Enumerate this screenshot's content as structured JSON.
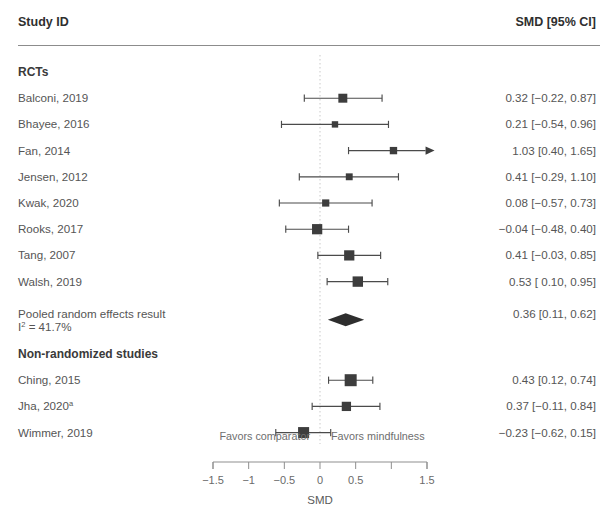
{
  "header": {
    "study_col_label": "Study ID",
    "estimate_col_label": "SMD [95% CI]"
  },
  "sections": [
    {
      "label": "RCTs"
    },
    {
      "label": "Non-randomized studies"
    }
  ],
  "pooled": {
    "label": "Pooled random effects result",
    "heterogeneity_prefix": "I",
    "heterogeneity_sup": "2",
    "heterogeneity_value": " = 41.7%",
    "estimate_text": "0.36 [0.11, 0.62]"
  },
  "axis": {
    "title": "SMD",
    "favors_left": "Favors comparator",
    "favors_right": "Favors mindfulness",
    "tick_values": [
      -1.5,
      -1,
      -0.5,
      0,
      0.5,
      1,
      1.5
    ],
    "tick_labels": [
      "−1.5",
      "−1",
      "−0.5",
      "0",
      "0.5",
      "",
      "1.5"
    ],
    "zero_reference": 0
  },
  "colors": {
    "marker": "#3d3d3d",
    "line": "#4b4b4b",
    "zero_line": "#c9c9c9",
    "rule": "#8c8c8c",
    "text": "#555555"
  },
  "chart_data": {
    "type": "forest",
    "title": "",
    "xlabel": "SMD",
    "ylabel": "",
    "xlim": [
      -1.75,
      1.75
    ],
    "effect_measure": "SMD",
    "ci_level": 95,
    "grid": false,
    "legend": "none",
    "groups": [
      {
        "name": "RCTs",
        "rows": [
          {
            "study": "Balconi, 2019",
            "estimate": 0.32,
            "ci_low": -0.22,
            "ci_high": 0.87,
            "weight": 0.62,
            "text": "0.32 [−0.22, 0.87]",
            "truncated_right": false
          },
          {
            "study": "Bhayee, 2016",
            "estimate": 0.21,
            "ci_low": -0.54,
            "ci_high": 0.96,
            "weight": 0.3,
            "text": "0.21 [−0.54, 0.96]",
            "truncated_right": false
          },
          {
            "study": "Fan, 2014",
            "estimate": 1.03,
            "ci_low": 0.4,
            "ci_high": 1.65,
            "weight": 0.42,
            "text": "1.03 [0.40, 1.65]",
            "truncated_right": true
          },
          {
            "study": "Jensen, 2012",
            "estimate": 0.41,
            "ci_low": -0.29,
            "ci_high": 1.1,
            "weight": 0.36,
            "text": "0.41 [−0.29, 1.10]",
            "truncated_right": false
          },
          {
            "study": "Kwak, 2020",
            "estimate": 0.08,
            "ci_low": -0.57,
            "ci_high": 0.73,
            "weight": 0.4,
            "text": "0.08 [−0.57, 0.73]",
            "truncated_right": false
          },
          {
            "study": "Rooks, 2017",
            "estimate": -0.04,
            "ci_low": -0.48,
            "ci_high": 0.4,
            "weight": 0.78,
            "text": "−0.04 [−0.48, 0.40]",
            "truncated_right": false
          },
          {
            "study": "Tang, 2007",
            "estimate": 0.41,
            "ci_low": -0.03,
            "ci_high": 0.85,
            "weight": 0.78,
            "text": "0.41 [−0.03, 0.85]",
            "truncated_right": false
          },
          {
            "study": "Walsh, 2019",
            "estimate": 0.53,
            "ci_low": 0.1,
            "ci_high": 0.95,
            "weight": 0.8,
            "text": "0.53 [ 0.10, 0.95]",
            "truncated_right": false
          }
        ],
        "summary": {
          "study": "Pooled random effects result",
          "estimate": 0.36,
          "ci_low": 0.11,
          "ci_high": 0.62,
          "text": "0.36 [0.11, 0.62]",
          "i_squared": 41.7
        }
      },
      {
        "name": "Non-randomized studies",
        "rows": [
          {
            "study": "Ching, 2015",
            "estimate": 0.43,
            "ci_low": 0.12,
            "ci_high": 0.74,
            "weight": 1.0,
            "text": "0.43 [0.12, 0.74]",
            "truncated_right": false
          },
          {
            "study": "Jha, 2020",
            "study_sup": "a",
            "estimate": 0.37,
            "ci_low": -0.11,
            "ci_high": 0.84,
            "weight": 0.66,
            "text": "0.37 [−0.11, 0.84]",
            "truncated_right": false
          },
          {
            "study": "Wimmer, 2019",
            "estimate": -0.23,
            "ci_low": -0.62,
            "ci_high": 0.15,
            "weight": 0.88,
            "text": "−0.23 [−0.62, 0.15]",
            "truncated_right": false
          }
        ]
      }
    ]
  }
}
